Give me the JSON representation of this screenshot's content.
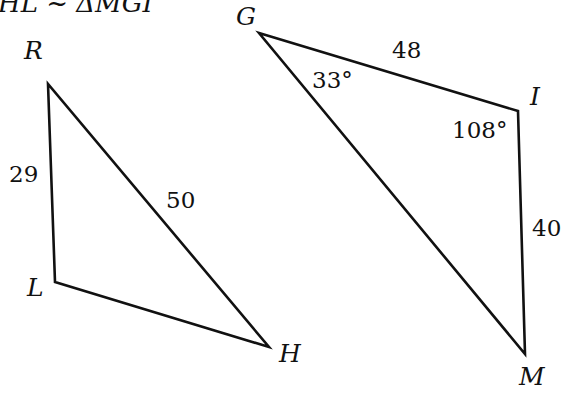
{
  "title": "HL ~ ΔMGI",
  "colors": {
    "stroke": "#111111",
    "background": "#ffffff"
  },
  "triangles": [
    {
      "name": "RHL",
      "vertices": [
        {
          "label": "R",
          "x": 48,
          "y": 84
        },
        {
          "label": "L",
          "x": 55,
          "y": 282
        },
        {
          "label": "H",
          "x": 269,
          "y": 347
        }
      ],
      "sides": [
        {
          "between": "R-L",
          "label": "29"
        },
        {
          "between": "R-H",
          "label": "50"
        }
      ]
    },
    {
      "name": "MGI",
      "vertices": [
        {
          "label": "G",
          "x": 259,
          "y": 33
        },
        {
          "label": "I",
          "x": 518,
          "y": 111
        },
        {
          "label": "M",
          "x": 525,
          "y": 354
        }
      ],
      "sides": [
        {
          "between": "G-I",
          "label": "48"
        },
        {
          "between": "I-M",
          "label": "40"
        }
      ],
      "angles": [
        {
          "at": "G",
          "label": "33°"
        },
        {
          "at": "I",
          "label": "108°"
        }
      ]
    }
  ],
  "labels": {
    "R": "R",
    "L": "L",
    "H": "H",
    "G": "G",
    "I": "I",
    "M": "M",
    "side_RL": "29",
    "side_RH": "50",
    "side_GI": "48",
    "side_IM": "40",
    "angle_G": "33°",
    "angle_I": "108°"
  }
}
